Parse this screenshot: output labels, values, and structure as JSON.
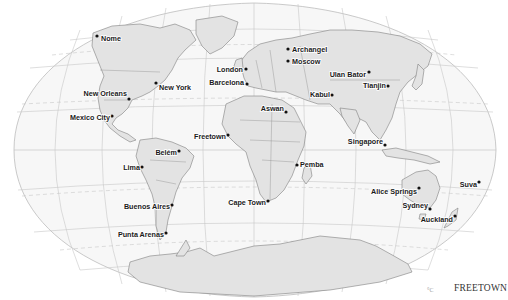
{
  "map": {
    "projection": "world-oval",
    "ocean_color": "#f7f7f7",
    "land_color": "#e3e3e3",
    "border_color": "#7a7a7a",
    "graticule_color": "#c4c4c4",
    "city_dot_color": "#111111"
  },
  "cities": [
    {
      "name": "Nome",
      "x": 97,
      "y": 36,
      "lx": 101,
      "ly": 41,
      "anchor": "start"
    },
    {
      "name": "Archangel",
      "x": 288,
      "y": 49,
      "lx": 292,
      "ly": 52,
      "anchor": "start"
    },
    {
      "name": "Moscow",
      "x": 288,
      "y": 61,
      "lx": 292,
      "ly": 64,
      "anchor": "start"
    },
    {
      "name": "London",
      "x": 246,
      "y": 69,
      "lx": 243,
      "ly": 72,
      "anchor": "end"
    },
    {
      "name": "Barcelona",
      "x": 247,
      "y": 84,
      "lx": 244,
      "ly": 85,
      "anchor": "end"
    },
    {
      "name": "Ulan Bator",
      "x": 369,
      "y": 72,
      "lx": 366,
      "ly": 77,
      "anchor": "end"
    },
    {
      "name": "Tianjin",
      "x": 388,
      "y": 86,
      "lx": 386,
      "ly": 88,
      "anchor": "end"
    },
    {
      "name": "Kabul",
      "x": 332,
      "y": 95,
      "lx": 330,
      "ly": 97,
      "anchor": "end"
    },
    {
      "name": "Aswan",
      "x": 286,
      "y": 112,
      "lx": 284,
      "ly": 111,
      "anchor": "end"
    },
    {
      "name": "New York",
      "x": 156,
      "y": 83,
      "lx": 159,
      "ly": 90,
      "anchor": "start"
    },
    {
      "name": "New Orleans",
      "x": 129,
      "y": 99,
      "lx": 127,
      "ly": 96,
      "anchor": "end"
    },
    {
      "name": "Mexico City",
      "x": 112,
      "y": 116,
      "lx": 110,
      "ly": 120,
      "anchor": "end"
    },
    {
      "name": "Freetown",
      "x": 228,
      "y": 135,
      "lx": 226,
      "ly": 139,
      "anchor": "end"
    },
    {
      "name": "Singapore",
      "x": 385,
      "y": 145,
      "lx": 383,
      "ly": 144,
      "anchor": "end"
    },
    {
      "name": "Belém",
      "x": 179,
      "y": 151,
      "lx": 177,
      "ly": 155,
      "anchor": "end"
    },
    {
      "name": "Lima",
      "x": 142,
      "y": 167,
      "lx": 140,
      "ly": 170,
      "anchor": "end"
    },
    {
      "name": "Pemba",
      "x": 297,
      "y": 165,
      "lx": 300,
      "ly": 167,
      "anchor": "start"
    },
    {
      "name": "Alice Springs",
      "x": 419,
      "y": 188,
      "lx": 417,
      "ly": 194,
      "anchor": "end"
    },
    {
      "name": "Suva",
      "x": 479,
      "y": 182,
      "lx": 477,
      "ly": 187,
      "anchor": "end"
    },
    {
      "name": "Sydney",
      "x": 430,
      "y": 209,
      "lx": 428,
      "ly": 208,
      "anchor": "end"
    },
    {
      "name": "Auckland",
      "x": 455,
      "y": 216,
      "lx": 453,
      "ly": 222,
      "anchor": "end"
    },
    {
      "name": "Cape Town",
      "x": 268,
      "y": 201,
      "lx": 266,
      "ly": 205,
      "anchor": "end"
    },
    {
      "name": "Buenos Aires",
      "x": 172,
      "y": 205,
      "lx": 170,
      "ly": 209,
      "anchor": "end"
    },
    {
      "name": "Punta Arenas",
      "x": 166,
      "y": 233,
      "lx": 164,
      "ly": 237,
      "anchor": "end"
    }
  ],
  "corner_label": "FREETOWN",
  "corner_glyph": "°C"
}
